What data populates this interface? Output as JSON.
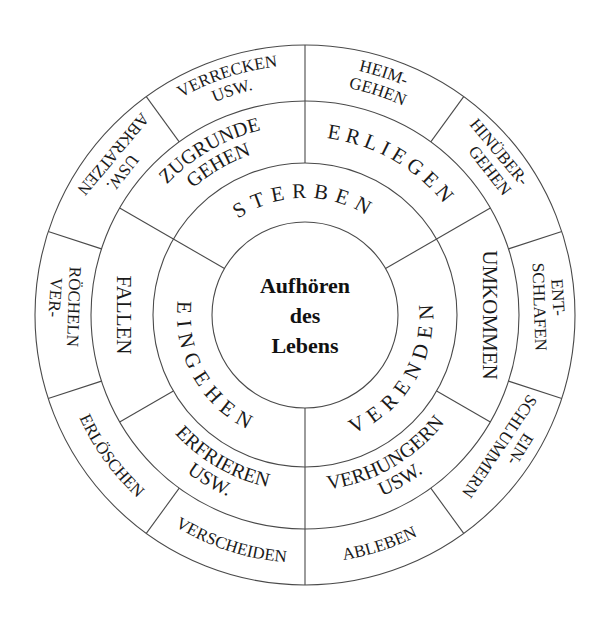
{
  "diagram": {
    "title": "Aufhören des Lebens",
    "center": {
      "lines": [
        "Aufhören",
        "des",
        "Lebens"
      ]
    },
    "inner_ring": [
      {
        "label": "STERBEN",
        "start": 210,
        "end": 330
      },
      {
        "label": "VERENDEN",
        "start": 330,
        "end": 450
      },
      {
        "label": "EINGEHEN",
        "start": 90,
        "end": 210
      }
    ],
    "middle_ring": [
      {
        "lines": [
          "ZUGRUNDE",
          "GEHEN"
        ],
        "start": 210,
        "end": 270
      },
      {
        "lines": [
          "ERLIEGEN"
        ],
        "start": 270,
        "end": 330
      },
      {
        "lines": [
          "UMKOMMEN"
        ],
        "start": 330,
        "end": 390
      },
      {
        "lines": [
          "VERHUNGERN",
          "USW."
        ],
        "start": 30,
        "end": 90
      },
      {
        "lines": [
          "ERFRIEREN",
          "USW."
        ],
        "start": 90,
        "end": 150
      },
      {
        "lines": [
          "FALLEN"
        ],
        "start": 150,
        "end": 210
      }
    ],
    "outer_ring": [
      {
        "lines": [
          "HEIM-",
          "GEHEN"
        ],
        "start": 270,
        "end": 306
      },
      {
        "lines": [
          "HINÜBER-",
          "GEHEN"
        ],
        "start": 306,
        "end": 342
      },
      {
        "lines": [
          "ENT-",
          "SCHLAFEN"
        ],
        "start": 342,
        "end": 378
      },
      {
        "lines": [
          "EIN-",
          "SCHLUMMERN"
        ],
        "start": 18,
        "end": 54
      },
      {
        "lines": [
          "ABLEBEN"
        ],
        "start": 54,
        "end": 90
      },
      {
        "lines": [
          "VERSCHEIDEN"
        ],
        "start": 90,
        "end": 126
      },
      {
        "lines": [
          "ERLÖSCHEN"
        ],
        "start": 126,
        "end": 162
      },
      {
        "lines": [
          "VER-",
          "RÖCHELN"
        ],
        "start": 162,
        "end": 198
      },
      {
        "lines": [
          "ABKRATZEN",
          "USW."
        ],
        "start": 198,
        "end": 234
      },
      {
        "lines": [
          "VERRECKEN",
          "USW."
        ],
        "start": 234,
        "end": 270
      }
    ],
    "colors": {
      "line": "#4a4a4a",
      "text": "#1a1a1a",
      "background": "#ffffff"
    }
  }
}
